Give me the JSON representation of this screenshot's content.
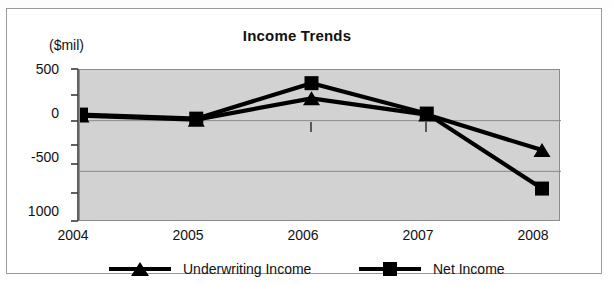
{
  "chart_data": {
    "type": "line",
    "title": "Income Trends",
    "xlabel": "",
    "ylabel": "($mil)",
    "categories": [
      "2004",
      "2005",
      "2006",
      "2007",
      "2008"
    ],
    "x": [
      2004,
      2005,
      2006,
      2007,
      2008
    ],
    "ylim": [
      -1000,
      500
    ],
    "y_ticks": [
      500,
      0,
      -500,
      -1000
    ],
    "y_tick_labels": [
      "500",
      "0",
      "-500",
      "1000"
    ],
    "grid": true,
    "legend_position": "bottom",
    "plot_background": "#d2d2d2",
    "line_color": "#000000",
    "series": [
      {
        "name": "Underwriting Income",
        "marker": "triangle",
        "values": [
          50,
          10,
          220,
          60,
          -290
        ]
      },
      {
        "name": "Net Income",
        "marker": "square",
        "values": [
          60,
          20,
          370,
          70,
          -670
        ]
      }
    ]
  },
  "chart": {
    "title": "Income Trends",
    "y_unit_label": "($mil)",
    "y_tick_labels": [
      "500",
      "0",
      "-500",
      "1000"
    ],
    "x_tick_labels": [
      "2004",
      "2005",
      "2006",
      "2007",
      "2008"
    ],
    "legend": [
      {
        "label": "Underwriting Income",
        "marker": "triangle-marker-icon"
      },
      {
        "label": "Net Income",
        "marker": "square-marker-icon"
      }
    ]
  }
}
